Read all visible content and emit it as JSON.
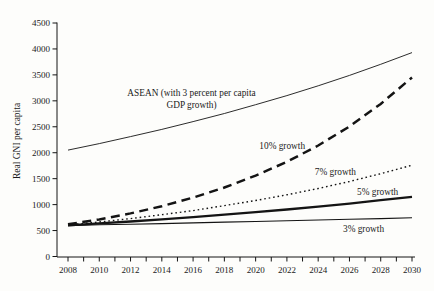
{
  "window": {
    "background": "#fdfdfb",
    "ink_color": "#141414"
  },
  "chart_data": {
    "type": "line",
    "title": "",
    "xlabel": "",
    "ylabel": "Real GNI per capita",
    "x": [
      2008,
      2010,
      2012,
      2014,
      2016,
      2018,
      2020,
      2022,
      2024,
      2026,
      2028,
      2030
    ],
    "xlim": [
      2008,
      2030
    ],
    "ylim": [
      0,
      4500
    ],
    "yticks": [
      0,
      500,
      1000,
      1500,
      2000,
      2500,
      3000,
      3500,
      4000,
      4500
    ],
    "xtick_label_step": 2,
    "xtick_minor_step": 1,
    "grid": false,
    "legend_position": "inline-annotations",
    "line_color": "#141414",
    "series": [
      {
        "name": "ASEAN (with 3 percent per capita GDP growth)",
        "style": "solid-hairline",
        "values": [
          2050,
          2175,
          2310,
          2450,
          2600,
          2755,
          2925,
          3100,
          3290,
          3490,
          3705,
          3930
        ]
      },
      {
        "name": "10% growth",
        "style": "dashed-thick",
        "values": [
          620,
          715,
          830,
          970,
          1135,
          1330,
          1560,
          1825,
          2140,
          2505,
          2940,
          3450
        ]
      },
      {
        "name": "7% growth",
        "style": "dotted",
        "values": [
          610,
          665,
          730,
          805,
          885,
          980,
          1080,
          1190,
          1310,
          1445,
          1595,
          1760
        ]
      },
      {
        "name": "5% growth",
        "style": "solid-thick",
        "values": [
          600,
          640,
          675,
          715,
          760,
          805,
          855,
          905,
          960,
          1020,
          1085,
          1150
        ]
      },
      {
        "name": "3% growth",
        "style": "solid-thin",
        "values": [
          595,
          610,
          622,
          635,
          648,
          662,
          675,
          689,
          703,
          717,
          731,
          745
        ]
      }
    ],
    "annotations": [
      {
        "lines": [
          "ASEAN (with 3 percent per capita",
          "GDP growth)"
        ],
        "year": 2015.9,
        "value": 3085
      },
      {
        "lines": [
          "10% growth"
        ],
        "year": 2021.7,
        "value": 2075
      },
      {
        "lines": [
          "7% growth"
        ],
        "year": 2025.1,
        "value": 1570
      },
      {
        "lines": [
          "5% growth"
        ],
        "year": 2027.8,
        "value": 1185
      },
      {
        "lines": [
          "3% growth"
        ],
        "year": 2026.9,
        "value": 470
      }
    ]
  }
}
